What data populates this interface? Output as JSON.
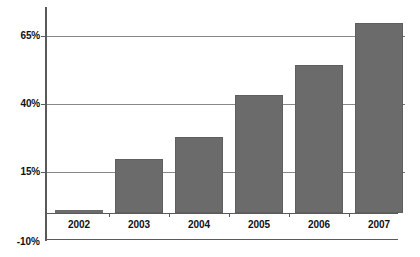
{
  "chart_data": {
    "type": "bar",
    "title": "",
    "subtitle": "",
    "xlabel": "",
    "ylabel": "",
    "categories": [
      "2002",
      "2003",
      "2004",
      "2005",
      "2006",
      "2007"
    ],
    "values": [
      1,
      20,
      28,
      43.5,
      54.5,
      70
    ],
    "series": [
      {
        "name": "",
        "values": [
          1,
          20,
          28,
          43.5,
          54.5,
          70
        ]
      }
    ],
    "ylim": [
      -10,
      75
    ],
    "yticks": [
      -10,
      15,
      40,
      65
    ],
    "ytick_labels": [
      "-10%",
      "15%",
      "40%",
      "65%"
    ],
    "xtick_labels": [
      "2002",
      "2003",
      "2004",
      "2005",
      "2006",
      "2007"
    ],
    "grid": true,
    "grid_axis": "y",
    "legend": false,
    "legend_position": "none",
    "bar_color": "#6b6b6b",
    "grid_color": "#888888",
    "axis_color": "#5a5a5a",
    "background_color": "#ffffff",
    "annotations": []
  },
  "axis": {
    "y_labels": [
      {
        "text": "65%",
        "value": 65
      },
      {
        "text": "40%",
        "value": 40
      },
      {
        "text": "15%",
        "value": 15
      },
      {
        "text": "-10%",
        "value": -10
      }
    ],
    "x_labels": [
      {
        "text": "2002"
      },
      {
        "text": "2003"
      },
      {
        "text": "2004"
      },
      {
        "text": "2005"
      },
      {
        "text": "2006"
      },
      {
        "text": "2007"
      }
    ]
  }
}
